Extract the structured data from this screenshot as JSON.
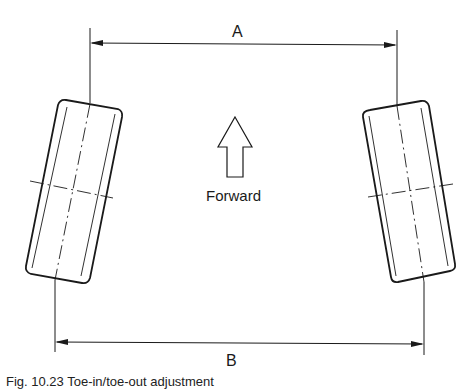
{
  "figure": {
    "dimensions": [
      {
        "label": "A",
        "description": "Distance between front edges of wheels (top)"
      },
      {
        "label": "B",
        "description": "Distance between rear edges of wheels (bottom)"
      }
    ],
    "direction_label": "Forward",
    "direction_icon": "up-arrow-outline-icon",
    "caption": "Fig. 10.23 Toe-in/toe-out adjustment"
  },
  "colors": {
    "line": "#1a1a1a",
    "background": "#ffffff"
  }
}
